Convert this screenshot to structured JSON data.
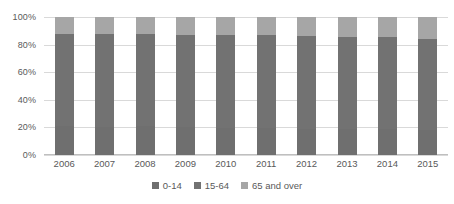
{
  "chart_data": {
    "type": "bar",
    "stacked": true,
    "stack_total": 100,
    "title": "",
    "subtitle": "",
    "xlabel": "",
    "ylabel": "",
    "ylim": [
      0,
      100
    ],
    "yticks": [
      0,
      20,
      40,
      60,
      80,
      100
    ],
    "ytick_labels": [
      "0%",
      "20%",
      "40%",
      "60%",
      "80%",
      "100%"
    ],
    "grid": true,
    "legend_position": "bottom",
    "categories": [
      "2006",
      "2007",
      "2008",
      "2009",
      "2010",
      "2011",
      "2012",
      "2013",
      "2014",
      "2015"
    ],
    "series": [
      {
        "name": "0-14",
        "color": "#6f6f6f",
        "values": [
          20.8,
          20.6,
          20.8,
          20.5,
          19.9,
          19.5,
          19.2,
          18.9,
          18.6,
          18.2
        ]
      },
      {
        "name": "15-64",
        "color": "#727272",
        "values": [
          67.0,
          67.1,
          66.8,
          66.7,
          67.1,
          67.3,
          67.0,
          66.7,
          66.6,
          66.1
        ]
      },
      {
        "name": "65 and over",
        "color": "#a6a6a6",
        "values": [
          12.2,
          12.3,
          12.4,
          12.8,
          13.0,
          13.2,
          13.8,
          14.4,
          14.8,
          15.7
        ]
      }
    ],
    "legend_entries": [
      {
        "label": "0-14",
        "color": "#6f6f6f"
      },
      {
        "label": "15-64",
        "color": "#727272"
      },
      {
        "label": "65 and over",
        "color": "#a6a6a6"
      }
    ],
    "colors": {
      "gridline": "#d9d9d9",
      "axis": "#bfbfbf",
      "tick_text": "#595959",
      "background": "#ffffff"
    }
  }
}
